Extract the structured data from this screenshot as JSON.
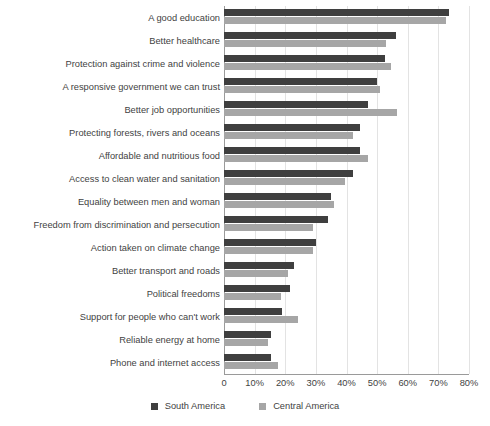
{
  "chart_data": {
    "type": "bar",
    "orientation": "horizontal",
    "title": "",
    "subtitle": "",
    "xlabel": "",
    "ylabel": "",
    "xlim": [
      0,
      80
    ],
    "xticks": [
      "0",
      "10%",
      "20%",
      "30%",
      "40%",
      "50%",
      "60%",
      "70%",
      "80%"
    ],
    "xtick_values": [
      0,
      10,
      20,
      30,
      40,
      50,
      60,
      70,
      80
    ],
    "grid": true,
    "grid_axis": "x",
    "legend_position": "bottom",
    "categories": [
      "A good education",
      "Better healthcare",
      "Protection against crime and violence",
      "A responsive government we can trust",
      "Better job opportunities",
      "Protecting forests, rivers and oceans",
      "Affordable and nutritious food",
      "Access to clean water and sanitation",
      "Equality between men and woman",
      "Freedom from discrimination and persecution",
      "Action taken on climate change",
      "Better transport and roads",
      "Political freedoms",
      "Support for people who can't work",
      "Reliable energy at home",
      "Phone and internet access"
    ],
    "series": [
      {
        "name": "South America",
        "color": "#3f3f3f",
        "values": [
          73.5,
          56,
          52.5,
          50,
          47,
          44.5,
          44.5,
          42,
          35,
          34,
          30,
          23,
          21.5,
          19,
          15.5,
          15.5
        ]
      },
      {
        "name": "Central America",
        "color": "#a6a6a6",
        "values": [
          72.5,
          53,
          54.5,
          51,
          56.5,
          42,
          47,
          39.5,
          36,
          29,
          29,
          21,
          18.5,
          24,
          14.5,
          17.5
        ]
      }
    ]
  },
  "legend": {
    "items": [
      {
        "label": "South America",
        "color": "#3f3f3f"
      },
      {
        "label": "Central America",
        "color": "#a6a6a6"
      }
    ]
  }
}
